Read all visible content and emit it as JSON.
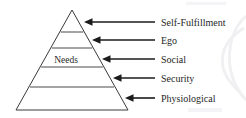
{
  "diagram": {
    "type": "pyramid-hierarchy",
    "background_color": "#ffffff",
    "stroke_color": "#3a3a3a",
    "arrow_color": "#1b1b1b",
    "text_color": "#262626",
    "inner_label": "Needs",
    "tier_count": 5,
    "tiers": [
      {
        "index": 1,
        "position": "apex",
        "label": "Self-Fulfillment",
        "arrow": "left-arrow-icon",
        "arrow_tip_x": 84,
        "arrow_tail_x": 155,
        "arrow_y": 22,
        "label_x": 161,
        "label_y": 25
      },
      {
        "index": 2,
        "position": "second",
        "label": "Ego",
        "arrow": "left-arrow-icon",
        "arrow_tip_x": 92,
        "arrow_tail_x": 155,
        "arrow_y": 40,
        "label_x": 161,
        "label_y": 43
      },
      {
        "index": 3,
        "position": "middle",
        "label": "Social",
        "arrow": "left-arrow-icon",
        "arrow_tip_x": 102,
        "arrow_tail_x": 155,
        "arrow_y": 59,
        "label_x": 161,
        "label_y": 62
      },
      {
        "index": 4,
        "position": "fourth",
        "label": "Security",
        "arrow": "left-arrow-icon",
        "arrow_tip_x": 113,
        "arrow_tail_x": 155,
        "arrow_y": 78,
        "label_x": 161,
        "label_y": 81
      },
      {
        "index": 5,
        "position": "base",
        "label": "Physiological",
        "arrow": "left-arrow-icon",
        "arrow_tip_x": 125,
        "arrow_tail_x": 155,
        "arrow_y": 98,
        "label_x": 161,
        "label_y": 101
      }
    ],
    "geometry": {
      "apex_x": 72,
      "apex_y": 10,
      "base_left_x": 16,
      "base_right_x": 128,
      "base_y": 110,
      "divider_y": [
        32,
        48,
        67,
        87
      ],
      "inner_label_x": 66,
      "inner_label_y": 63
    }
  }
}
